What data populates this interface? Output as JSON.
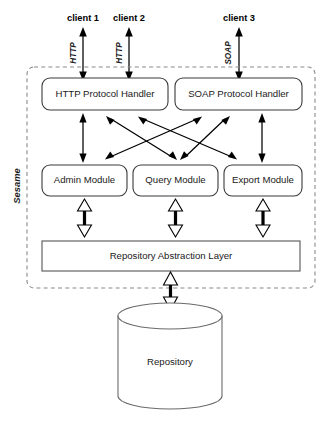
{
  "diagram": {
    "boundary_label": "Sesame",
    "clients": [
      {
        "label": "client 1",
        "protocol": "HTTP"
      },
      {
        "label": "client 2",
        "protocol": "HTTP"
      },
      {
        "label": "client 3",
        "protocol": "SOAP"
      }
    ],
    "protocol_handlers": [
      {
        "label": "HTTP Protocol Handler"
      },
      {
        "label": "SOAP Protocol Handler"
      }
    ],
    "modules": [
      {
        "label": "Admin Module"
      },
      {
        "label": "Query Module"
      },
      {
        "label": "Export Module"
      }
    ],
    "abstraction_layer": {
      "label": "Repository Abstraction Layer"
    },
    "repository": {
      "label": "Repository"
    },
    "colors": {
      "background": "#ffffff",
      "box_stroke": "#3a3a3a",
      "boundary_stroke": "#8a8a8a",
      "arrow": "#000000",
      "text": "#1a1a1a"
    }
  }
}
